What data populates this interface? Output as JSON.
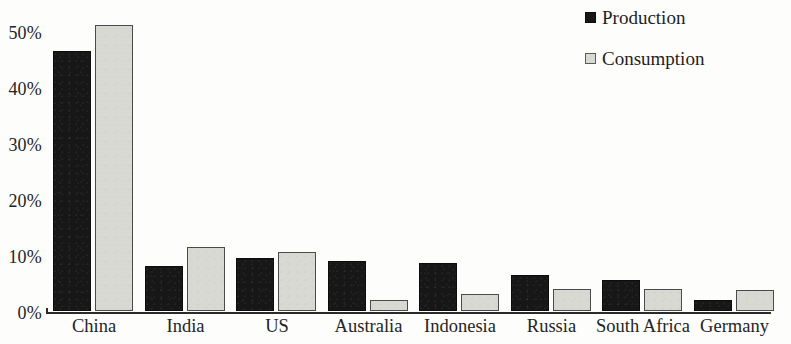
{
  "chart_data": {
    "type": "bar",
    "title": "",
    "subtitle": "",
    "xlabel": "",
    "ylabel": "",
    "ylim": [
      0,
      52
    ],
    "grid": false,
    "legend_position": "top-right",
    "y_ticks": [
      "0%",
      "10%",
      "20%",
      "30%",
      "40%",
      "50%"
    ],
    "y_tick_values": [
      0,
      10,
      20,
      30,
      40,
      50
    ],
    "categories": [
      "China",
      "India",
      "US",
      "Australia",
      "Indonesia",
      "Russia",
      "South Africa",
      "Germany"
    ],
    "series": [
      {
        "name": "Production",
        "color": "#171717",
        "values": [
          46.5,
          8.0,
          9.5,
          9.0,
          8.5,
          6.5,
          5.5,
          2.0
        ]
      },
      {
        "name": "Consumption",
        "color": "#d9d9d4",
        "values": [
          51.0,
          11.5,
          10.5,
          2.0,
          3.0,
          4.0,
          4.0,
          3.7
        ]
      }
    ]
  },
  "legend": {
    "items": [
      {
        "label": "Production",
        "swatch": "production-swatch"
      },
      {
        "label": "Consumption",
        "swatch": "consumption-swatch"
      }
    ]
  }
}
